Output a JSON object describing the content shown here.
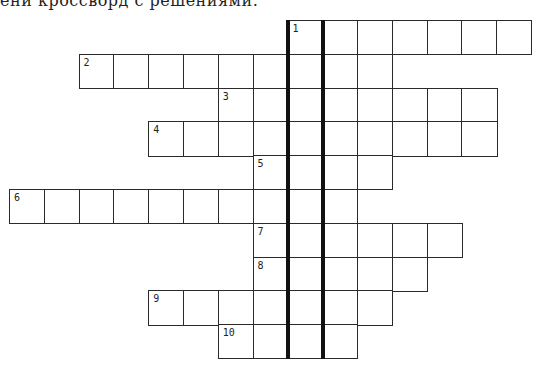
{
  "header": {
    "text": "ени кроссворд с решениями."
  },
  "crossword": {
    "cell_width": 34.8,
    "cell_height": 33.8,
    "origin_x": 9,
    "origin_y": 20,
    "highlight_column": 8,
    "rows": [
      {
        "number": "1",
        "row": 0,
        "start_col": 8,
        "end_col": 14
      },
      {
        "number": "2",
        "row": 1,
        "start_col": 2,
        "end_col": 10
      },
      {
        "number": "3",
        "row": 2,
        "start_col": 6,
        "end_col": 13
      },
      {
        "number": "4",
        "row": 3,
        "start_col": 4,
        "end_col": 13
      },
      {
        "number": "5",
        "row": 4,
        "start_col": 7,
        "end_col": 10
      },
      {
        "number": "6",
        "row": 5,
        "start_col": 0,
        "end_col": 9
      },
      {
        "number": "7",
        "row": 6,
        "start_col": 7,
        "end_col": 12
      },
      {
        "number": "8",
        "row": 7,
        "start_col": 7,
        "end_col": 11
      },
      {
        "number": "9",
        "row": 8,
        "start_col": 4,
        "end_col": 10
      },
      {
        "number": "10",
        "row": 9,
        "start_col": 6,
        "end_col": 9
      }
    ],
    "line_color": "#2a2a2a",
    "highlight_line_color": "#111111"
  }
}
